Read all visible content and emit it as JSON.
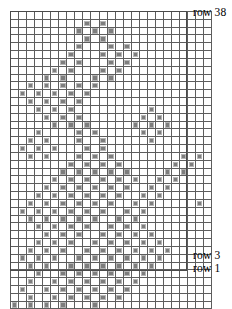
{
  "figure": {
    "kind": "knitting-chart",
    "columns": 25,
    "rows": 38,
    "colors": {
      "grid_line": "#5d5d5d",
      "frame": "#4a4a4a",
      "filled_cell": "#7d7d7d",
      "filled_cell_border": "#b4b4b4",
      "empty_cell": "#ffffff",
      "label_text": "#000000"
    }
  },
  "labels": {
    "top": "row 38",
    "bottom_odd": "row 3",
    "bottom_first": "row 1"
  },
  "chart_data": {
    "type": "heatmap",
    "title": "",
    "xlabel": "",
    "ylabel": "",
    "columns": 25,
    "rows": 38,
    "row_numbering": "bottom-up, row 1 at bottom, row 38 at top",
    "legend": [
      {
        "symbol": "filled-square",
        "meaning": "worked / colored stitch"
      },
      {
        "symbol": "empty-square",
        "meaning": "background stitch"
      }
    ],
    "annotations": [
      "row 38",
      "row 3",
      "row 1"
    ],
    "grid": [
      "0000000000000000000000000",
      "0000000001010000000000000",
      "0000000010101000000000000",
      "0000000001010000000000000",
      "0000000010001010000000000",
      "0000000100010101000000000",
      "0000001010001010000000000",
      "0000010100010100000000000",
      "0000101000101000000000000",
      "0010101010100000000000000",
      "0101010101000000000000000",
      "0010101010000000000000000",
      "0001010100000000010000000",
      "0000101010000000101000000",
      "0000010101000001010100000",
      "0001000010100000101000000",
      "0010100010010000010000000",
      "0101010001010000000000000",
      "0010100010101000000001010",
      "0000000101010100000010100",
      "0000001010101010000101000",
      "0000010101010101001010000",
      "0000101010101010010100000",
      "0001010101010100101000000",
      "0010101010101001010000010",
      "0101010101010010100000000",
      "0010101010100101000000000",
      "0001010101001010100000000",
      "0000101010010101010000000",
      "0001010100101010101000000",
      "0010101001010101010100000",
      "0101010010101010101000000",
      "0010100101010101010000000",
      "0001001010101010100000000",
      "0010010101010101000000000",
      "0100101010101010000000000",
      "0010010101010100000000000",
      "1010101000100000000000000"
    ]
  }
}
